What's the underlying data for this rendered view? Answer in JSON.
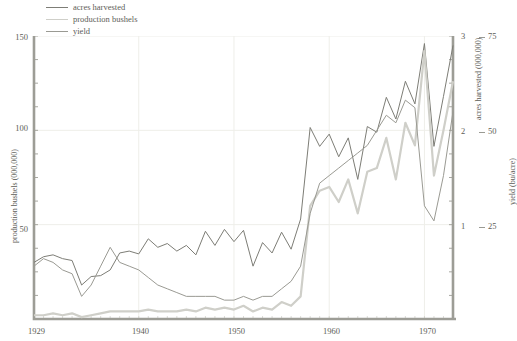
{
  "legend": {
    "items": [
      {
        "label": "acres harvested",
        "color": "#7d7d76"
      },
      {
        "label": "production bushels",
        "color": "#cfcfc9"
      },
      {
        "label": "yield",
        "color": "#9a9a93"
      }
    ]
  },
  "axes": {
    "left_title": "production bushels (000,000)",
    "right1_title": "acres harvested (000,000)",
    "right2_title": "yield (bu/acre)",
    "left_ticks": [
      "150",
      "100",
      "50"
    ],
    "right1_ticks": [
      "3",
      "2",
      "1"
    ],
    "right2_ticks": [
      "75",
      "50",
      "25"
    ],
    "x_ticks": [
      "1929",
      "1940",
      "1950",
      "1960",
      "1970"
    ]
  },
  "chart_data": {
    "type": "line",
    "title": "",
    "xlabel": "",
    "ylabel": "production bushels (000,000)",
    "grid": true,
    "legend_position": "top-left",
    "xlim": [
      1929,
      1973
    ],
    "x": [
      1929,
      1930,
      1931,
      1932,
      1933,
      1934,
      1935,
      1936,
      1937,
      1938,
      1939,
      1940,
      1941,
      1942,
      1943,
      1944,
      1945,
      1946,
      1947,
      1948,
      1949,
      1950,
      1951,
      1952,
      1953,
      1954,
      1955,
      1956,
      1957,
      1958,
      1959,
      1960,
      1961,
      1962,
      1963,
      1964,
      1965,
      1966,
      1967,
      1968,
      1969,
      1970,
      1971,
      1972,
      1973
    ],
    "axes_ranges": {
      "production_bushels": [
        0,
        150
      ],
      "acres_harvested": [
        0,
        3
      ],
      "yield_bu_acre": [
        0,
        75
      ]
    },
    "series": [
      {
        "name": "acres harvested",
        "axis": "right1",
        "unit": "000,000",
        "ylim": [
          0,
          3
        ],
        "color": "#7d7d76",
        "values": [
          0.6,
          0.66,
          0.68,
          0.64,
          0.62,
          0.36,
          0.45,
          0.46,
          0.52,
          0.7,
          0.72,
          0.69,
          0.85,
          0.76,
          0.8,
          0.72,
          0.78,
          0.68,
          0.93,
          0.78,
          0.95,
          0.82,
          0.94,
          0.56,
          0.81,
          0.7,
          0.92,
          0.74,
          1.06,
          2.03,
          1.83,
          1.96,
          1.72,
          1.92,
          1.48,
          2.04,
          1.98,
          2.35,
          2.12,
          2.52,
          2.28,
          2.92,
          1.83,
          2.36,
          2.9
        ]
      },
      {
        "name": "production bushels",
        "axis": "left",
        "unit": "000,000",
        "ylim": [
          0,
          150
        ],
        "color": "#cfcfc9",
        "values": [
          2,
          2,
          3,
          2,
          3,
          1,
          2,
          3,
          4,
          4,
          4,
          4,
          5,
          4,
          4,
          4,
          5,
          4,
          6,
          5,
          6,
          5,
          7,
          4,
          6,
          5,
          9,
          7,
          12,
          60,
          68,
          70,
          62,
          74,
          56,
          78,
          80,
          96,
          74,
          104,
          92,
          142,
          76,
          100,
          126
        ]
      },
      {
        "name": "yield",
        "axis": "right2",
        "unit": "bu/acre",
        "ylim": [
          0,
          75
        ],
        "color": "#9a9a93",
        "values": [
          14,
          16,
          15,
          13,
          12,
          6,
          9,
          14,
          19,
          15,
          14,
          13,
          11,
          9,
          8,
          7,
          6,
          6,
          6,
          6,
          5,
          5,
          6,
          5,
          6,
          6,
          8,
          10,
          14,
          28,
          36,
          38,
          40,
          42,
          44,
          46,
          50,
          54,
          52,
          58,
          56,
          30,
          26,
          38,
          55
        ]
      }
    ]
  }
}
